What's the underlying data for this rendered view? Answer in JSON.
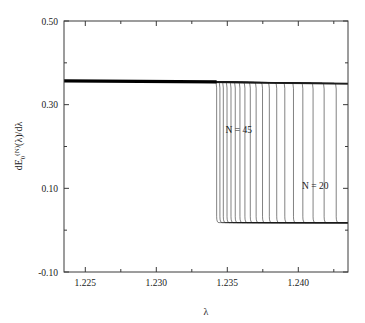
{
  "chart_data": {
    "type": "line",
    "title": "",
    "xlabel": "λ",
    "ylabel": "dE₀^(N)(λ)/dλ",
    "xlim": [
      1.2235,
      1.2435
    ],
    "ylim": [
      -0.1,
      0.5
    ],
    "grid": false,
    "legend": "none",
    "xticks": [
      1.225,
      1.23,
      1.235,
      1.24
    ],
    "xtick_labels": [
      "1.225",
      "1.230",
      "1.235",
      "1.240"
    ],
    "yticks": [
      -0.1,
      0.1,
      0.3,
      0.5
    ],
    "ytick_labels": [
      "-0.10",
      "0.10",
      "0.30",
      "0.50"
    ],
    "x_minor_ticks": [
      1.2275,
      1.2325,
      1.2375,
      1.2425
    ],
    "y_minor_ticks": [
      0.0,
      0.2,
      0.4
    ],
    "annotations": [
      {
        "text": "N = 45",
        "x": 1.2358,
        "y": 0.232
      },
      {
        "text": "N = 20",
        "x": 1.2412,
        "y": 0.098
      }
    ],
    "upper_plateau_left_value": 0.357,
    "upper_plateau_right_value": 0.347,
    "lower_plateau_value": 0.018,
    "series_description": "Ground-state energy derivative dE0(N)(lambda)/dlambda for chain sizes N = 20 to N = 45; each curve drops sharply from the upper branch to the lower branch at an N-dependent critical lambda, with the jump moving to larger lambda as N decreases.",
    "series": [
      {
        "name": "N = 45",
        "jump_x": 1.23425,
        "upper": 0.3545,
        "lower": 0.018
      },
      {
        "name": "N = 44",
        "jump_x": 1.23448,
        "upper": 0.3544,
        "lower": 0.018
      },
      {
        "name": "N = 43",
        "jump_x": 1.23472,
        "upper": 0.3543,
        "lower": 0.018
      },
      {
        "name": "N = 42",
        "jump_x": 1.23498,
        "upper": 0.3542,
        "lower": 0.018
      },
      {
        "name": "N = 41",
        "jump_x": 1.23526,
        "upper": 0.3541,
        "lower": 0.018
      },
      {
        "name": "N = 40",
        "jump_x": 1.23556,
        "upper": 0.354,
        "lower": 0.018
      },
      {
        "name": "N = 39",
        "jump_x": 1.23589,
        "upper": 0.3539,
        "lower": 0.018
      },
      {
        "name": "N = 38",
        "jump_x": 1.23624,
        "upper": 0.3538,
        "lower": 0.018
      },
      {
        "name": "N = 37",
        "jump_x": 1.23662,
        "upper": 0.3536,
        "lower": 0.018
      },
      {
        "name": "N = 36",
        "jump_x": 1.23703,
        "upper": 0.3535,
        "lower": 0.018
      },
      {
        "name": "N = 35",
        "jump_x": 1.23748,
        "upper": 0.3533,
        "lower": 0.018
      },
      {
        "name": "N = 34",
        "jump_x": 1.23796,
        "upper": 0.3532,
        "lower": 0.018
      },
      {
        "name": "N = 33",
        "jump_x": 1.23848,
        "upper": 0.353,
        "lower": 0.018
      },
      {
        "name": "N = 32",
        "jump_x": 1.23905,
        "upper": 0.3528,
        "lower": 0.018
      },
      {
        "name": "N = 31",
        "jump_x": 1.23966,
        "upper": 0.3526,
        "lower": 0.018
      },
      {
        "name": "N = 30",
        "jump_x": 1.24032,
        "upper": 0.3524,
        "lower": 0.018
      },
      {
        "name": "N = 29",
        "jump_x": 1.24104,
        "upper": 0.3521,
        "lower": 0.018
      },
      {
        "name": "N = 28",
        "jump_x": 1.24182,
        "upper": 0.3519,
        "lower": 0.018
      },
      {
        "name": "N = 27",
        "jump_x": 1.24267,
        "upper": 0.3516,
        "lower": 0.018
      },
      {
        "name": "N = 26",
        "jump_x": 1.2436,
        "upper": 0.3513,
        "lower": 0.018
      },
      {
        "name": "N = 25",
        "jump_x": 1.24462,
        "upper": 0.351,
        "lower": 0.018
      },
      {
        "name": "N = 24",
        "jump_x": 1.24573,
        "upper": 0.3506,
        "lower": 0.018
      },
      {
        "name": "N = 23",
        "jump_x": 1.24695,
        "upper": 0.3502,
        "lower": 0.018
      },
      {
        "name": "N = 22",
        "jump_x": 1.24829,
        "upper": 0.3498,
        "lower": 0.018
      },
      {
        "name": "N = 21",
        "jump_x": 1.24976,
        "upper": 0.3493,
        "lower": 0.018
      },
      {
        "name": "N = 20",
        "jump_x": 1.25139,
        "upper": 0.3488,
        "lower": 0.018
      }
    ]
  }
}
